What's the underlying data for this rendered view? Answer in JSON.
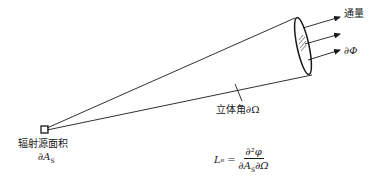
{
  "diagram": {
    "type": "radiance-geometry",
    "labels": {
      "flux_label": "通量",
      "flux_symbol": "∂Φ",
      "solid_angle": "立体角∂Ω",
      "source_area_label": "辐射源面积",
      "source_area_symbol": "∂A",
      "source_area_subscript": "S"
    },
    "formula": {
      "lhs": "L",
      "lhs_subscript": "e",
      "equals": "=",
      "numerator": "∂²φ",
      "denominator_a": "∂A",
      "denominator_a_subscript": "S",
      "denominator_b": "∂Ω"
    },
    "colors": {
      "line": "#1a1a1a",
      "background": "#ffffff"
    }
  }
}
